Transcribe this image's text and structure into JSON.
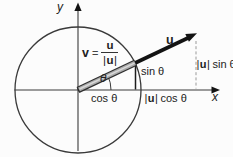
{
  "figure": {
    "axes": {
      "x_label": "x",
      "y_label": "y"
    },
    "vector_u": {
      "label": "u"
    },
    "v_equation": {
      "lhs": "v",
      "equals": "=",
      "numerator": "u",
      "den_open": "|",
      "den_vec": "u",
      "den_close": "|"
    },
    "angle": {
      "label": "θ"
    },
    "projections": {
      "sin_label": "sin θ",
      "cos_label": "cos θ",
      "u_sin": {
        "open": "|",
        "vec": "u",
        "close": "|",
        "trig": "sin θ"
      },
      "u_cos": {
        "open": "|",
        "vec": "u",
        "close": "|",
        "trig": "cos θ"
      }
    },
    "colors": {
      "background": "#fcfcfc",
      "line": "#3a3a3a",
      "text": "#222222",
      "vector_u": "#131313",
      "unit_vector_outline": "#2f2f2f",
      "unit_vector_fill": "#ababab",
      "unit_vector_highlight": "#d8d8d8",
      "dashed_guide": "#9a9a9a"
    }
  }
}
